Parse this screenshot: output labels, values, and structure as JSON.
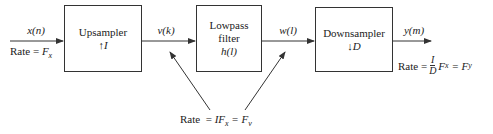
{
  "blocks": [
    {
      "id": "upsampler",
      "title": "Upsampler",
      "symbol": "↑",
      "param": "I"
    },
    {
      "id": "lowpass",
      "title_line1": "Lowpass",
      "title_line2": "filter",
      "param": "h(l)"
    },
    {
      "id": "downsampler",
      "title": "Downsampler",
      "symbol": "↓",
      "param": "D"
    }
  ],
  "signals": {
    "input": "x(n)",
    "after_upsampler": "v(k)",
    "after_filter": "w(l)",
    "output": "y(m)"
  },
  "rates": {
    "input": {
      "prefix": "Rate = ",
      "value": "F",
      "sub": "x"
    },
    "intermediate": {
      "prefix": "Rate  = ",
      "value": "IF",
      "sub": "x",
      "equals": " = F",
      "sub2": "v"
    },
    "output": {
      "prefix": "Rate  = ",
      "num": "I",
      "den": "D",
      "value": "F",
      "sub": "x",
      "equals": " = F",
      "sub2": "y"
    }
  }
}
